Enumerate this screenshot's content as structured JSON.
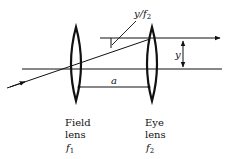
{
  "diagram": {
    "type": "optics-ray-diagram",
    "labels": {
      "angle": "y/f",
      "angle_sub": "2",
      "height": "y",
      "separation": "a",
      "field_lens_line1": "Field",
      "field_lens_line2": "lens",
      "field_lens_f": "f",
      "field_lens_f_sub": "1",
      "eye_lens_line1": "Eye",
      "eye_lens_line2": "lens",
      "eye_lens_f": "f",
      "eye_lens_f_sub": "2"
    },
    "colors": {
      "ink": "#111111",
      "background": "#ffffff"
    }
  }
}
